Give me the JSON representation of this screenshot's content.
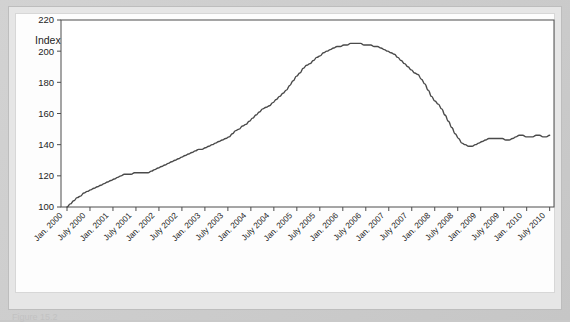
{
  "chart_data": {
    "type": "line",
    "title": "Index (January 2000 = 100)",
    "xlabel": "",
    "ylabel": "",
    "ylim": [
      100,
      220
    ],
    "ytick_values": [
      100,
      120,
      140,
      160,
      180,
      200,
      220
    ],
    "grid": false,
    "legend": null,
    "x_tick_labels": [
      "Jan. 2000",
      "July 2000",
      "Jan. 2001",
      "July 2001",
      "Jan. 2002",
      "July 2002",
      "Jan. 2003",
      "July 2003",
      "Jan. 2004",
      "July 2004",
      "Jan. 2005",
      "July 2005",
      "Jan. 2006",
      "July 2006",
      "Jan. 2007",
      "July 2007",
      "Jan. 2008",
      "July 2008",
      "Jan. 2009",
      "July 2009",
      "Jan. 2010",
      "July 2010"
    ],
    "series": [
      {
        "name": "Index",
        "color": "#4a4a4a",
        "x": [
          "Jan. 2000",
          "July 2000",
          "Jan. 2001",
          "July 2001",
          "Jan. 2002",
          "July 2002",
          "Jan. 2003",
          "July 2003",
          "Jan. 2004",
          "July 2004",
          "Jan. 2005",
          "July 2005",
          "Jan. 2006",
          "July 2006",
          "Jan. 2007",
          "July 2007",
          "Jan. 2008",
          "July 2008",
          "Jan. 2009",
          "July 2009",
          "Jan. 2010",
          "July 2010"
        ],
        "values": [
          100,
          110,
          116,
          121,
          122,
          128,
          134,
          139,
          145,
          155,
          165,
          178,
          192,
          201,
          205,
          204,
          199,
          185,
          166,
          140,
          144,
          145
        ]
      }
    ],
    "monthly_values": [
      100,
      102,
      104,
      106,
      107,
      109,
      110,
      111,
      112,
      113,
      114,
      115,
      116,
      117,
      118,
      119,
      120,
      121,
      121,
      121,
      122,
      122,
      122,
      122,
      122,
      123,
      124,
      125,
      126,
      127,
      128,
      129,
      130,
      131,
      132,
      133,
      134,
      135,
      136,
      137,
      137,
      138,
      139,
      140,
      141,
      142,
      143,
      144,
      145,
      147,
      149,
      150,
      152,
      153,
      155,
      157,
      159,
      161,
      163,
      164,
      165,
      167,
      169,
      171,
      173,
      175,
      178,
      181,
      184,
      186,
      189,
      191,
      192,
      194,
      196,
      197,
      199,
      200,
      201,
      202,
      203,
      203,
      204,
      204,
      205,
      205,
      205,
      205,
      204,
      204,
      204,
      203,
      203,
      202,
      201,
      200,
      199,
      198,
      196,
      194,
      192,
      190,
      188,
      186,
      185,
      182,
      179,
      175,
      171,
      168,
      166,
      163,
      159,
      155,
      151,
      147,
      144,
      141,
      140,
      139,
      139,
      140,
      141,
      142,
      143,
      144,
      144,
      144,
      144,
      144,
      143,
      143,
      144,
      145,
      146,
      146,
      145,
      145,
      145,
      146,
      146,
      145,
      145,
      146
    ],
    "annotations": {
      "peak_label": "205",
      "trough_label": "139",
      "start_label": "100"
    }
  },
  "caption": {
    "text": "Figure 15.2"
  }
}
